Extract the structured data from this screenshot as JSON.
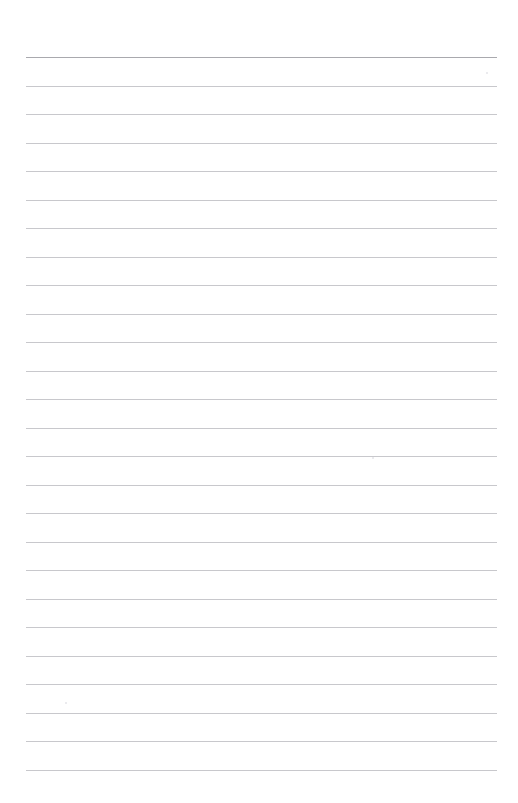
{
  "document": {
    "type": "lined-paper",
    "title": "",
    "page_text": "",
    "notes": ""
  },
  "page": {
    "width": 518,
    "height": 803,
    "background_color": "#ffffff"
  },
  "ruling": {
    "line_count": 26,
    "first_line_y": 57,
    "line_spacing": 28.5,
    "left_x": 26,
    "right_x": 497,
    "line_color": "#c8c8cc",
    "head_line_color": "#a9a9ae",
    "head_line_index": 0,
    "line_ys": [
      57,
      85.5,
      114,
      142.5,
      171,
      199.5,
      228,
      256.5,
      285,
      313.5,
      342,
      370.5,
      399,
      427.5,
      456,
      484.5,
      513,
      541.5,
      570,
      598.5,
      627,
      655.5,
      684,
      712.5,
      741,
      769.5
    ]
  },
  "margins": {
    "top": 57,
    "bottom": 33,
    "left": 26,
    "right": 21
  },
  "specks": [
    {
      "x": 65,
      "y": 702,
      "size": 2
    },
    {
      "x": 372,
      "y": 457,
      "size": 2
    },
    {
      "x": 486,
      "y": 72,
      "size": 2
    }
  ]
}
